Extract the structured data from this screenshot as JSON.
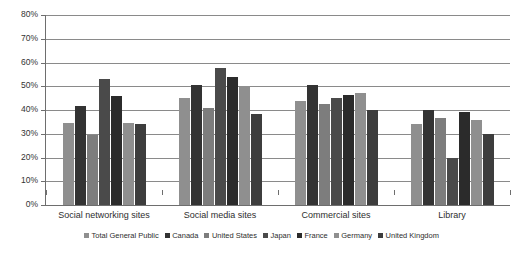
{
  "chart_data": {
    "type": "bar",
    "title": "",
    "subtitle": "",
    "xlabel": "",
    "ylabel": "",
    "ylim": [
      0,
      80
    ],
    "ytick_step": 10,
    "ytick_labels": [
      "0%",
      "10%",
      "20%",
      "30%",
      "40%",
      "50%",
      "60%",
      "70%",
      "80%"
    ],
    "ytick_values": [
      0,
      10,
      20,
      30,
      40,
      50,
      60,
      70,
      80
    ],
    "grid": true,
    "grid_axis": "y",
    "legend_position": "bottom",
    "value_suffix": "%",
    "categories": [
      "Social networking sites",
      "Social media sites",
      "Commercial sites",
      "Library"
    ],
    "series": [
      {
        "name": "Total General Public",
        "color": "#8f8f8f",
        "values": [
          34.5,
          45.0,
          44.0,
          34.0
        ]
      },
      {
        "name": "Canada",
        "color": "#333333",
        "values": [
          41.5,
          50.5,
          50.5,
          40.0
        ]
      },
      {
        "name": "United States",
        "color": "#7d7d7d",
        "values": [
          29.5,
          41.0,
          42.5,
          36.5
        ]
      },
      {
        "name": "Japan",
        "color": "#4a4a4a",
        "values": [
          53.0,
          57.5,
          45.0,
          20.0
        ]
      },
      {
        "name": "France",
        "color": "#2b2b2b",
        "values": [
          46.0,
          54.0,
          46.5,
          39.0
        ]
      },
      {
        "name": "Germany",
        "color": "#8f8f8f",
        "values": [
          34.5,
          50.0,
          47.0,
          36.0
        ]
      },
      {
        "name": "United Kingdom",
        "color": "#3d3d3d",
        "values": [
          34.0,
          38.5,
          40.0,
          30.0
        ]
      }
    ]
  }
}
